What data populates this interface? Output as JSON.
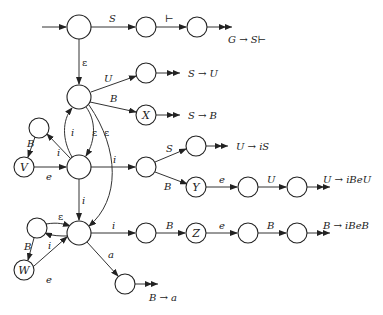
{
  "diagram": {
    "type": "state-automaton",
    "nodes": [
      {
        "id": "n0",
        "label": "",
        "x": 79,
        "y": 27,
        "r": 12
      },
      {
        "id": "n1",
        "label": "",
        "x": 146,
        "y": 27,
        "r": 10
      },
      {
        "id": "n2",
        "label": "",
        "x": 197,
        "y": 27,
        "r": 10
      },
      {
        "id": "nS",
        "label": "",
        "x": 79,
        "y": 97,
        "r": 12
      },
      {
        "id": "n3",
        "label": "",
        "x": 146,
        "y": 73,
        "r": 10
      },
      {
        "id": "nX",
        "label": "X",
        "x": 146,
        "y": 115,
        "r": 10
      },
      {
        "id": "nVt",
        "label": "",
        "x": 39,
        "y": 128,
        "r": 10
      },
      {
        "id": "nV",
        "label": "V",
        "x": 24,
        "y": 167,
        "r": 10
      },
      {
        "id": "nU",
        "label": "",
        "x": 79,
        "y": 167,
        "r": 12
      },
      {
        "id": "n4",
        "label": "",
        "x": 146,
        "y": 167,
        "r": 10
      },
      {
        "id": "n5",
        "label": "",
        "x": 196,
        "y": 146,
        "r": 10
      },
      {
        "id": "nY",
        "label": "Y",
        "x": 196,
        "y": 187,
        "r": 10
      },
      {
        "id": "n6",
        "label": "",
        "x": 248,
        "y": 187,
        "r": 10
      },
      {
        "id": "n7",
        "label": "",
        "x": 297,
        "y": 187,
        "r": 10
      },
      {
        "id": "nWt",
        "label": "",
        "x": 37,
        "y": 228,
        "r": 10
      },
      {
        "id": "nW",
        "label": "W",
        "x": 24,
        "y": 270,
        "r": 10
      },
      {
        "id": "nB",
        "label": "",
        "x": 79,
        "y": 233,
        "r": 12
      },
      {
        "id": "n8",
        "label": "",
        "x": 146,
        "y": 233,
        "r": 10
      },
      {
        "id": "nZ",
        "label": "Z",
        "x": 196,
        "y": 233,
        "r": 10
      },
      {
        "id": "n9",
        "label": "",
        "x": 248,
        "y": 233,
        "r": 10
      },
      {
        "id": "n10",
        "label": "",
        "x": 297,
        "y": 233,
        "r": 10
      },
      {
        "id": "n11",
        "label": "",
        "x": 125,
        "y": 284,
        "r": 10
      }
    ],
    "edge_labels": {
      "start_S": "S",
      "top_end": "⊢",
      "eps_down": "ε",
      "U1": "U",
      "B1": "B",
      "i_up": "i",
      "eps_mid": "ε",
      "eps_long": "ε",
      "B_left": "B",
      "i_left": "i",
      "e_left": "e",
      "i_right": "i",
      "S2": "S",
      "B2": "B",
      "e2": "e",
      "U2": "U",
      "i_down": "i",
      "eps_lower": "ε",
      "B_lower": "B",
      "i_lower": "i",
      "e_lower": "e",
      "i3": "i",
      "B3": "B",
      "e3": "e",
      "B4": "B",
      "a": "a"
    },
    "reductions": [
      {
        "text": "G → S⊢",
        "x": 228,
        "y": 43
      },
      {
        "text": "S → U",
        "x": 188,
        "y": 77
      },
      {
        "text": "S → B",
        "x": 188,
        "y": 119
      },
      {
        "text": "U → iS",
        "x": 238,
        "y": 150
      },
      {
        "text": "U → iBeU",
        "x": 323,
        "y": 183
      },
      {
        "text": "B → iBeB",
        "x": 323,
        "y": 229
      },
      {
        "text": "B → a",
        "x": 149,
        "y": 301
      }
    ]
  }
}
